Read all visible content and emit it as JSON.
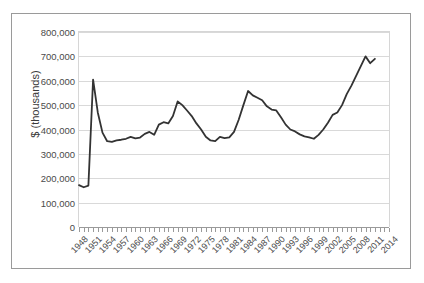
{
  "chart_data": {
    "type": "line",
    "title": "",
    "xlabel": "",
    "ylabel": "$ (thousands)",
    "ylim": [
      0,
      800000
    ],
    "ytick_values": [
      0,
      100000,
      200000,
      300000,
      400000,
      500000,
      600000,
      700000,
      800000
    ],
    "ytick_labels": [
      "0",
      "100,000",
      "200,000",
      "300,000",
      "400,000",
      "500,000",
      "600,000",
      "700,000",
      "800,000"
    ],
    "xlim": [
      1948,
      2014
    ],
    "xtick_labels": [
      "1948",
      "1951",
      "1954",
      "1957",
      "1960",
      "1963",
      "1966",
      "1969",
      "1972",
      "1975",
      "1978",
      "1981",
      "1984",
      "1987",
      "1990",
      "1993",
      "1996",
      "1999",
      "2002",
      "2005",
      "2008",
      "2011",
      "2014"
    ],
    "xtick_step": 3,
    "minor_ticks_every_year": true,
    "grid": "horizontal",
    "legend": "none",
    "line_color": "#333333",
    "line_width": 1.8,
    "x": [
      1948,
      1949,
      1950,
      1951,
      1952,
      1953,
      1954,
      1955,
      1956,
      1957,
      1958,
      1959,
      1960,
      1961,
      1962,
      1963,
      1964,
      1965,
      1966,
      1967,
      1968,
      1969,
      1970,
      1971,
      1972,
      1973,
      1974,
      1975,
      1976,
      1977,
      1978,
      1979,
      1980,
      1981,
      1982,
      1983,
      1984,
      1985,
      1986,
      1987,
      1988,
      1989,
      1990,
      1991,
      1992,
      1993,
      1994,
      1995,
      1996,
      1997,
      1998,
      1999,
      2000,
      2001,
      2002,
      2003,
      2004,
      2005,
      2006,
      2007,
      2008,
      2009,
      2010,
      2011
    ],
    "y": [
      172000,
      163000,
      170000,
      605000,
      470000,
      387000,
      352000,
      349000,
      355000,
      358000,
      362000,
      370000,
      364000,
      367000,
      382000,
      390000,
      378000,
      420000,
      430000,
      425000,
      455000,
      515000,
      500000,
      478000,
      455000,
      425000,
      400000,
      370000,
      355000,
      352000,
      370000,
      365000,
      368000,
      390000,
      440000,
      500000,
      558000,
      540000,
      530000,
      520000,
      495000,
      482000,
      478000,
      450000,
      420000,
      400000,
      392000,
      380000,
      372000,
      368000,
      362000,
      378000,
      400000,
      428000,
      460000,
      470000,
      500000,
      545000,
      580000,
      620000,
      660000,
      700000,
      672000,
      690000
    ]
  }
}
